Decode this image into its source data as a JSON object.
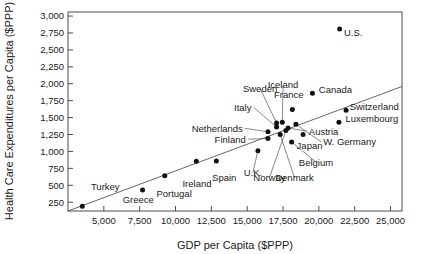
{
  "chart_data": {
    "type": "scatter",
    "title": "",
    "xlabel": "GDP per Capita ($PPP)",
    "ylabel": "Health Care Expenditures per Capita ($PPP)",
    "xlim": [
      2500,
      25800
    ],
    "ylim": [
      120,
      3060
    ],
    "xticks": [
      5000,
      7500,
      10000,
      12500,
      15000,
      17500,
      20000,
      22500,
      25000
    ],
    "xtick_labels": [
      "5,000",
      "7,500",
      "10,000",
      "12,500",
      "15,000",
      "17,500",
      "20,000",
      "22,500",
      "25,000"
    ],
    "yticks": [
      250,
      500,
      750,
      1000,
      1250,
      1500,
      1750,
      2000,
      2250,
      2500,
      2750,
      3000
    ],
    "ytick_labels": [
      "250",
      "500",
      "750",
      "1,000",
      "1,250",
      "1,500",
      "1,750",
      "2,000",
      "2,250",
      "2,500",
      "2,750",
      "3,000"
    ],
    "grid": false,
    "legend": false,
    "has_trendline": true,
    "trendline": {
      "x0": 2500,
      "y0": 120,
      "x1": 25800,
      "y1": 1960
    },
    "points": [
      {
        "label": "Turkey",
        "x": 3500,
        "y": 190,
        "label_x": 4100,
        "label_y": 430,
        "label_anchor": "start",
        "leader": false
      },
      {
        "label": "Greece",
        "x": 7700,
        "y": 430,
        "label_x": 7400,
        "label_y": 235,
        "label_anchor": "middle",
        "leader": false
      },
      {
        "label": "Portugal",
        "x": 9250,
        "y": 640,
        "label_x": 9900,
        "label_y": 330,
        "label_anchor": "middle",
        "leader": false
      },
      {
        "label": "Ireland",
        "x": 11450,
        "y": 855,
        "label_x": 11500,
        "label_y": 480,
        "label_anchor": "middle",
        "leader": false
      },
      {
        "label": "Spain",
        "x": 12850,
        "y": 860,
        "label_x": 13400,
        "label_y": 560,
        "label_anchor": "middle",
        "leader": false
      },
      {
        "label": "U.K.",
        "x": 15750,
        "y": 1010,
        "label_x": 15400,
        "label_y": 640,
        "label_anchor": "middle",
        "leader": true
      },
      {
        "label": "Netherlands",
        "x": 16450,
        "y": 1290,
        "label_x": 14700,
        "label_y": 1290,
        "label_anchor": "end",
        "leader": true
      },
      {
        "label": "Finland",
        "x": 16450,
        "y": 1190,
        "label_x": 14900,
        "label_y": 1130,
        "label_anchor": "end",
        "leader": true
      },
      {
        "label": "Italy",
        "x": 17050,
        "y": 1360,
        "label_x": 15300,
        "label_y": 1600,
        "label_anchor": "end",
        "leader": true
      },
      {
        "label": "Sweden",
        "x": 17050,
        "y": 1420,
        "label_x": 15900,
        "label_y": 1880,
        "label_anchor": "middle",
        "leader": true
      },
      {
        "label": "Iceland",
        "x": 17450,
        "y": 1430,
        "label_x": 17500,
        "label_y": 1930,
        "label_anchor": "middle",
        "leader": true
      },
      {
        "label": "Norway",
        "x": 17700,
        "y": 1310,
        "label_x": 16550,
        "label_y": 560,
        "label_anchor": "middle",
        "leader": true
      },
      {
        "label": "Denmark",
        "x": 17300,
        "y": 1250,
        "label_x": 18300,
        "label_y": 560,
        "label_anchor": "middle",
        "leader": true
      },
      {
        "label": "Belgium",
        "x": 18100,
        "y": 1140,
        "label_x": 19800,
        "label_y": 790,
        "label_anchor": "middle",
        "leader": true
      },
      {
        "label": "Japan",
        "x": 18900,
        "y": 1250,
        "label_x": 19350,
        "label_y": 1040,
        "label_anchor": "middle",
        "leader": false
      },
      {
        "label": "Austria",
        "x": 17850,
        "y": 1345,
        "label_x": 19300,
        "label_y": 1250,
        "label_anchor": "start",
        "leader": true
      },
      {
        "label": "W. Germany",
        "x": 18400,
        "y": 1400,
        "label_x": 20300,
        "label_y": 1090,
        "label_anchor": "start",
        "leader": true
      },
      {
        "label": "France",
        "x": 18150,
        "y": 1620,
        "label_x": 17900,
        "label_y": 1790,
        "label_anchor": "middle",
        "leader": false
      },
      {
        "label": "Canada",
        "x": 19550,
        "y": 1860,
        "label_x": 20000,
        "label_y": 1865,
        "label_anchor": "start",
        "leader": false
      },
      {
        "label": "Switzerland",
        "x": 21900,
        "y": 1610,
        "label_x": 22150,
        "label_y": 1610,
        "label_anchor": "start",
        "leader": false
      },
      {
        "label": "Luxembourg",
        "x": 21400,
        "y": 1430,
        "label_x": 21850,
        "label_y": 1430,
        "label_anchor": "start",
        "leader": false
      },
      {
        "label": "U.S.",
        "x": 21450,
        "y": 2810,
        "label_x": 21750,
        "label_y": 2700,
        "label_anchor": "start",
        "leader": false
      }
    ]
  }
}
